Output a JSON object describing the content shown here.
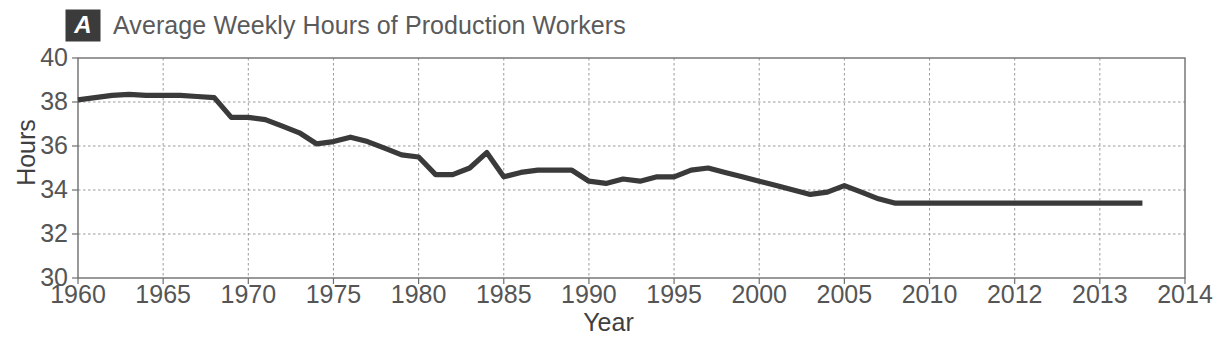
{
  "figure": {
    "panel_label": "A",
    "title": "Average Weekly Hours of Production Workers",
    "top_bleed_text": "",
    "line_color": "#3a3a3a",
    "axis_color": "#6e6e6e",
    "grid_color": "#9a9a9a",
    "badge_bg": "#3b3b3b",
    "badge_fg": "#ffffff",
    "title_color": "#5a5a5a"
  },
  "chart_data": {
    "type": "line",
    "title": "Average Weekly Hours of Production Workers",
    "xlabel": "Year",
    "ylabel": "Hours",
    "ylim": [
      30,
      40
    ],
    "xlim": [
      1960,
      2014
    ],
    "yticks": [
      30,
      32,
      34,
      36,
      38,
      40
    ],
    "ytick_labels": [
      "30",
      "32",
      "34",
      "36",
      "38",
      "40"
    ],
    "xtick_labels": [
      "1960",
      "1965",
      "1970",
      "1975",
      "1980",
      "1985",
      "1990",
      "1995",
      "2000",
      "2005",
      "2010",
      "2012",
      "2013",
      "2014"
    ],
    "xtick_values": [
      1960,
      1965,
      1970,
      1975,
      1980,
      1985,
      1990,
      1995,
      2000,
      2005,
      2010,
      2012,
      2013,
      2014
    ],
    "xtick_spacing": "uniform-by-index",
    "grid": "dashed-both-axes",
    "legend": "none",
    "series": [
      {
        "name": "Average weekly hours",
        "x": [
          1960,
          1961,
          1962,
          1963,
          1964,
          1965,
          1966,
          1967,
          1968,
          1969,
          1970,
          1971,
          1972,
          1973,
          1974,
          1975,
          1976,
          1977,
          1978,
          1979,
          1980,
          1981,
          1982,
          1983,
          1984,
          1985,
          1986,
          1987,
          1988,
          1989,
          1990,
          1991,
          1992,
          1993,
          1994,
          1995,
          1996,
          1997,
          1998,
          1999,
          2000,
          2001,
          2002,
          2003,
          2004,
          2005,
          2006,
          2007,
          2008,
          2009,
          2010,
          2011,
          2012,
          2013,
          2013.5
        ],
        "y": [
          38.1,
          38.2,
          38.3,
          38.35,
          38.3,
          38.3,
          38.3,
          38.25,
          38.2,
          37.3,
          37.3,
          37.2,
          36.9,
          36.6,
          36.1,
          36.2,
          36.4,
          36.2,
          35.9,
          35.6,
          35.5,
          34.7,
          34.7,
          35.0,
          35.7,
          34.6,
          34.8,
          34.9,
          34.9,
          34.9,
          34.4,
          34.3,
          34.5,
          34.4,
          34.6,
          34.6,
          34.9,
          35.0,
          34.8,
          34.6,
          34.4,
          34.2,
          34.0,
          33.8,
          33.9,
          34.2,
          33.9,
          33.6,
          33.4,
          33.4,
          33.4,
          33.4,
          33.4,
          33.4,
          33.4
        ]
      }
    ],
    "annotations": [
      {
        "text": "Peak plateau near 38.3 hours in the mid-1960s"
      },
      {
        "text": "Step decline in 1969 to about 37.3 hours"
      },
      {
        "text": "Recession dip to 34.7 hours in 1982"
      },
      {
        "text": "Short spike to about 35.7 hours in 1984"
      },
      {
        "text": "Local peak of 35.0 hours in 1996-1997"
      },
      {
        "text": "Bump to 34.2 hours in 2005"
      },
      {
        "text": "Flat at about 33.4 hours from 2008 onward"
      }
    ]
  }
}
